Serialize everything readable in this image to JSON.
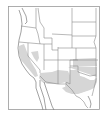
{
  "map": {
    "type": "species-range-map",
    "region": "Western United States",
    "colors": {
      "background": "#ffffff",
      "frame": "#9a9a9a",
      "state_lines": "#8a8a8a",
      "coast_lines": "#7a7a7a",
      "range_fill": "#d6d6d6"
    },
    "range_areas": [
      "California Central Valley",
      "Western Nevada",
      "Southern Arizona",
      "Southern New Mexico",
      "Texas",
      "Oklahoma",
      "Southern Kansas"
    ]
  }
}
